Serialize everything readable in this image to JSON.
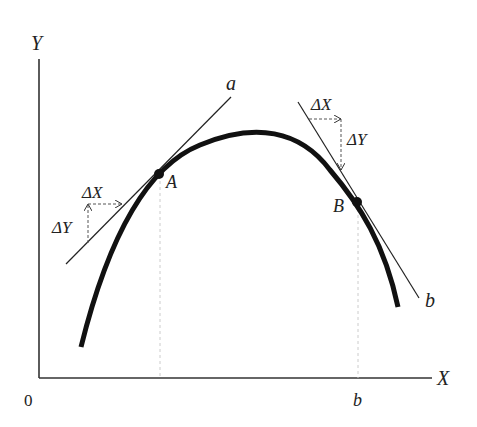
{
  "diagram": {
    "axes": {
      "y_label": "Y",
      "x_label": "X",
      "origin_label": "0",
      "x_tick_label": "b"
    },
    "curve": {
      "stroke": "#111111"
    },
    "point_a": {
      "label": "A",
      "tangent_label": "a",
      "delta_x": "ΔX",
      "delta_y": "ΔY"
    },
    "point_b": {
      "label": "B",
      "tangent_label": "b",
      "delta_x": "ΔX",
      "delta_y": "ΔY"
    }
  }
}
